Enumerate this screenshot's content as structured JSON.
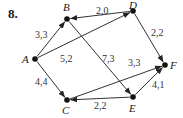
{
  "problem_number": "8.",
  "nodes": [
    {
      "id": "A",
      "label": "A",
      "x": 35,
      "y": 59,
      "lx": 22,
      "ly": 63
    },
    {
      "id": "B",
      "label": "B",
      "x": 67,
      "y": 19,
      "lx": 63,
      "ly": 11
    },
    {
      "id": "D",
      "label": "D",
      "x": 133,
      "y": 11,
      "lx": 129,
      "ly": 9
    },
    {
      "id": "F",
      "label": "F",
      "x": 165,
      "y": 65,
      "lx": 170,
      "ly": 69
    },
    {
      "id": "E",
      "label": "E",
      "x": 133,
      "y": 97,
      "lx": 129,
      "ly": 112
    },
    {
      "id": "C",
      "label": "C",
      "x": 67,
      "y": 100,
      "lx": 62,
      "ly": 114
    }
  ],
  "edges": [
    {
      "from": "A",
      "to": "B",
      "label": "3,3",
      "lx": 35,
      "ly": 38
    },
    {
      "from": "D",
      "to": "B",
      "label": "2,0",
      "lx": 96,
      "ly": 14
    },
    {
      "from": "A",
      "to": "D",
      "label": "5,2",
      "lx": 60,
      "ly": 62
    },
    {
      "from": "B",
      "to": "E",
      "label": "7,3",
      "lx": 102,
      "ly": 62
    },
    {
      "from": "D",
      "to": "F",
      "label": "2,2",
      "lx": 151,
      "ly": 36
    },
    {
      "from": "C",
      "to": "F",
      "label": "3,3",
      "lx": 128,
      "ly": 66
    },
    {
      "from": "A",
      "to": "C",
      "label": "4,4",
      "lx": 35,
      "ly": 85
    },
    {
      "from": "E",
      "to": "C",
      "label": "2,2",
      "lx": 94,
      "ly": 109
    },
    {
      "from": "E",
      "to": "F",
      "label": "4,1",
      "lx": 152,
      "ly": 88
    }
  ],
  "colors": {
    "line": "#333333",
    "node": "#111111"
  }
}
